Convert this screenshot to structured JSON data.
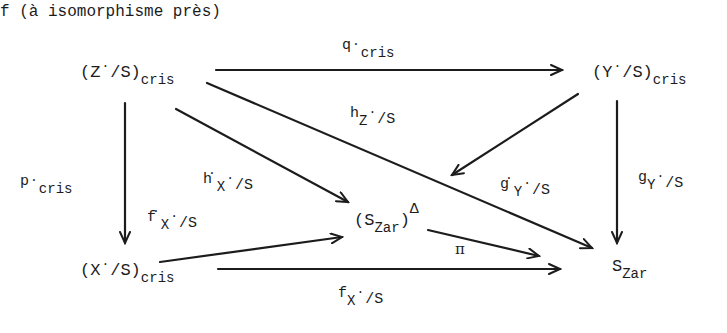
{
  "header": {
    "text": "f (à isomorphisme près)"
  },
  "nodes": {
    "z_cris": {
      "open": "(Z",
      "dot": "·",
      "rest": "/S)",
      "sub": "cris"
    },
    "y_cris": {
      "open": "(Y",
      "dot": "·",
      "rest": "/S)",
      "sub": "cris"
    },
    "x_cris": {
      "open": "(X",
      "dot": "·",
      "rest": "/S)",
      "sub": "cris"
    },
    "s_zar_delta": {
      "open": "(S",
      "sub": "Zar",
      "close": ")",
      "sup": "Δ"
    },
    "s_zar": {
      "main": "S",
      "sub": "Zar"
    }
  },
  "arrows": {
    "q_cris": {
      "main": "q",
      "dot": "·",
      "sub": "cris"
    },
    "h_z": {
      "main": "h",
      "sub": "Z",
      "dot": "·",
      "rest": "/S"
    },
    "p_cris": {
      "main": "p",
      "dot": "·",
      "sub": "cris"
    },
    "h_x": {
      "main": "h",
      "dot": "·",
      "sub": "X",
      "dot2": "·",
      "rest": "/S"
    },
    "f_x_dot": {
      "main": "f",
      "dot": "·",
      "sub": "X",
      "dot2": "·",
      "rest": "/S"
    },
    "g_y_dot": {
      "main": "g",
      "dot": "·",
      "sub": "Y",
      "dot2": "·",
      "rest": "/S"
    },
    "g_y": {
      "main": "g",
      "sub": "Y",
      "dot": "·",
      "rest": "/S"
    },
    "pi": {
      "main": "π"
    },
    "f_x": {
      "main": "f",
      "sub": "X",
      "dot": "·",
      "rest": "/S"
    }
  }
}
